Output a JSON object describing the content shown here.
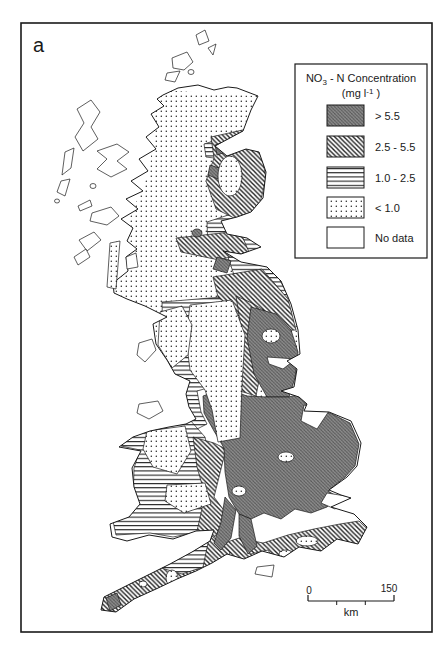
{
  "figure": {
    "panel_label": "a",
    "type": "choropleth-map"
  },
  "colors": {
    "ink": "#1a1a1a",
    "background": "#ffffff",
    "dark_zone_base": "#8f8f8f",
    "dark_zone_hatch": "#565656"
  },
  "legend": {
    "title_no": "NO",
    "title_sub": "3",
    "title_rest": " - N Concentration",
    "unit_open": "(mg l",
    "unit_sup": "-1",
    "unit_close": " )",
    "items": [
      {
        "label": "> 5.5",
        "pattern": "dark"
      },
      {
        "label": "2.5 - 5.5",
        "pattern": "diag"
      },
      {
        "label": "1.0 - 2.5",
        "pattern": "hlines"
      },
      {
        "label": "< 1.0",
        "pattern": "dots"
      },
      {
        "label": "No data",
        "pattern": "none"
      }
    ]
  },
  "scale_bar": {
    "start_label": "0",
    "end_label": "150",
    "unit_label": "km"
  },
  "map": {
    "categories": {
      "dark": "> 5.5 mg/l",
      "diag": "2.5 - 5.5 mg/l",
      "hlines": "1.0 - 2.5 mg/l",
      "dots": "< 1.0 mg/l",
      "none": "No data"
    },
    "mainland_path": "M163,95 L178,88 L198,85 L214,90 L228,87 L237,88 L258,96 L251,110 L243,131 L215,146 L227,156 L246,149 L259,152 L266,172 L263,198 L251,212 L237,217 L221,221 L227,234 L247,238 L261,247 L241,254 L223,251 L241,262 L267,267 L281,281 L291,304 L298,330 L300,354 L287,361 L297,369 L294,387 L281,391 L299,397 L307,404 L304,411 L329,412 L351,421 L361,443 L357,466 L347,477 L329,490 L341,495 L351,498 L331,507 L354,514 L367,527 L358,544 L337,539 L321,551 L299,547 L284,557 L262,551 L244,559 L227,554 L212,563 L196,571 L177,579 L156,589 L134,599 L116,612 L101,610 L104,597 L124,587 L146,576 L170,564 L192,552 L210,541 L214,530 L196,531 L173,539 L149,535 L127,541 L112,537 L110,524 L129,517 L140,504 L134,487 L132,468 L141,451 L119,447 L133,437 L150,431 L169,427 L186,424 L196,419 L189,407 L186,394 L190,381 L175,374 L167,360 L156,344 L153,324 L167,317 L145,306 L127,299 L114,293 L113,283 L128,271 L126,257 L137,249 L127,241 L133,228 L121,219 L138,209 L126,199 L143,191 L131,181 L148,171 L139,159 L156,149 L146,137 L159,127 L151,114 L164,106 L157,99 Z",
    "layers": [
      {
        "name": "scotland-north-england-base",
        "category": "dots",
        "clip": true,
        "type": "path",
        "stroke": false,
        "d": "M160,90 L258,96 L266,172 L262,250 L282,282 L298,330 L300,360 L293,392 L255,400 L215,385 L188,395 L170,372 L152,324 L112,290 L120,240 L150,170 L155,100 Z"
      },
      {
        "name": "moray-coast",
        "category": "hlines",
        "clip": true,
        "type": "path",
        "stroke": true,
        "d": "M204,144 L259,127 L267,147 L239,157 L222,159 L206,157 Z"
      },
      {
        "name": "tayside-fife",
        "category": "hlines",
        "clip": true,
        "type": "path",
        "stroke": true,
        "d": "M207,222 L262,204 L267,238 L262,253 L226,260 L208,249 Z"
      },
      {
        "name": "borders-coast",
        "category": "hlines",
        "clip": true,
        "type": "path",
        "stroke": true,
        "d": "M228,257 L270,262 L289,297 L263,299 L236,281 Z"
      },
      {
        "name": "pennines-ring",
        "category": "hlines",
        "clip": true,
        "type": "path",
        "stroke": true,
        "d": "M162,302 L246,295 L257,336 L250,390 L236,391 L218,385 L197,391 L201,412 L207,424 L195,430 L186,412 L180,396 L172,374 L163,338 Z"
      },
      {
        "name": "wales-band",
        "category": "hlines",
        "clip": true,
        "type": "path",
        "stroke": true,
        "d": "M113,431 L190,420 L205,437 L211,464 L201,494 L213,511 L212,529 L173,537 L150,533 L116,535 L113,521 L133,506 L134,468 L140,450 L121,446 Z"
      },
      {
        "name": "aberdeenshire",
        "category": "diag",
        "clip": true,
        "type": "path",
        "stroke": true,
        "d": "M211,137 L247,129 L261,149 L266,179 L258,211 L236,219 L216,209 L206,181 L214,158 Z"
      },
      {
        "name": "lothian",
        "category": "diag",
        "clip": true,
        "type": "path",
        "stroke": true,
        "d": "M176,238 L240,231 L249,252 L219,260 L181,252 Z"
      },
      {
        "name": "borders-cheviot",
        "category": "diag",
        "clip": true,
        "type": "path",
        "stroke": true,
        "d": "M213,277 L262,269 L288,299 L296,330 L271,331 L242,317 L218,297 Z"
      },
      {
        "name": "northeast-strip",
        "category": "diag",
        "clip": true,
        "type": "path",
        "stroke": true,
        "d": "M236,296 L252,303 L268,313 L263,360 L256,396 L240,391 L243,340 Z"
      },
      {
        "name": "welsh-border",
        "category": "diag",
        "clip": true,
        "type": "path",
        "stroke": true,
        "d": "M193,437 L214,443 L226,449 L214,497 L229,517 L213,539 L197,531 L205,495 L197,467 Z"
      },
      {
        "name": "south-coast-band",
        "category": "diag",
        "clip": true,
        "type": "path",
        "stroke": true,
        "d": "M216,546 L239,538 L263,543 L288,535 L314,529 L340,524 L359,521 L370,531 L357,549 L337,541 L320,553 L297,549 L281,560 L259,553 L241,561 L224,558 Z"
      },
      {
        "name": "southwest-peninsula",
        "category": "diag",
        "clip": true,
        "type": "path",
        "stroke": true,
        "d": "M212,536 L230,552 L228,560 L212,566 L194,574 L176,582 L154,592 L134,602 L117,614 L100,611 L104,596 L125,586 L147,575 L170,563 L192,551 Z"
      },
      {
        "name": "northeast-england",
        "category": "dark",
        "clip": true,
        "type": "path",
        "stroke": true,
        "d": "M251,307 L276,314 L291,330 L298,352 L295,378 L289,397 L267,397 L254,374 L247,338 Z"
      },
      {
        "name": "midlands-east-england",
        "category": "dark",
        "clip": true,
        "type": "path",
        "stroke": true,
        "d": "M203,396 L225,388 L247,396 L267,397 L289,397 L303,393 L309,409 L330,413 L350,423 L359,444 L355,466 L345,477 L328,491 L338,497 L327,507 L311,513 L295,509 L281,519 L264,513 L251,519 L239,514 L229,497 L225,472 L224,448 L214,431 L204,413 Z"
      },
      {
        "name": "hampshire-tongue",
        "category": "dark",
        "clip": true,
        "type": "path",
        "stroke": true,
        "d": "M239,514 L251,519 L257,546 L248,554 L239,536 Z"
      },
      {
        "name": "wessex-tongue",
        "category": "dark",
        "clip": true,
        "type": "path",
        "stroke": true,
        "d": "M225,497 L236,510 L231,538 L221,550 L214,543 L221,522 Z"
      },
      {
        "name": "banff-patch",
        "category": "dark",
        "clip": true,
        "type": "path",
        "stroke": true,
        "d": "M215,145 L227,141 L229,151 L217,155 Z"
      },
      {
        "name": "aberdeen-patch",
        "category": "dark",
        "clip": true,
        "type": "path",
        "stroke": true,
        "d": "M210,165 L222,169 L218,179 L208,175 Z"
      },
      {
        "name": "lothian-patch",
        "category": "dark",
        "clip": true,
        "type": "path",
        "stroke": true,
        "d": "M217,257 L231,261 L227,273 L213,269 Z"
      },
      {
        "name": "clyde-patch",
        "category": "dark",
        "clip": true,
        "type": "ellipse",
        "stroke": true,
        "cx": 197,
        "cy": 233,
        "rx": 5,
        "ry": 4
      },
      {
        "name": "cornwall-tip-patch",
        "category": "dark",
        "clip": true,
        "type": "path",
        "stroke": true,
        "d": "M106,598 L117,593 L121,605 L110,611 Z"
      },
      {
        "name": "aberdeenshire-core",
        "category": "dots",
        "clip": true,
        "type": "ellipse",
        "stroke": true,
        "cx": 230,
        "cy": 176,
        "rx": 12,
        "ry": 20
      },
      {
        "name": "pennines-core",
        "category": "dots",
        "clip": true,
        "type": "path",
        "stroke": true,
        "d": "M190,305 L232,300 L245,335 L242,385 L240,438 L218,442 L212,410 L205,390 L190,370 L186,338 Z"
      },
      {
        "name": "lake-district-core",
        "category": "dots",
        "clip": true,
        "type": "path",
        "stroke": true,
        "d": "M160,312 L182,306 L192,325 L188,355 L172,368 L158,345 Z"
      },
      {
        "name": "north-wales-core",
        "category": "dots",
        "clip": true,
        "type": "path",
        "stroke": true,
        "d": "M147,431 L185,426 L191,451 L177,474 L153,467 L143,449 Z"
      },
      {
        "name": "south-wales-core",
        "category": "dots",
        "clip": true,
        "type": "path",
        "stroke": true,
        "d": "M167,485 L205,483 L211,504 L184,513 L165,501 Z"
      },
      {
        "name": "devon-interior",
        "category": "hlines",
        "clip": true,
        "type": "path",
        "stroke": true,
        "d": "M151,541 L209,538 L203,567 L182,574 L151,565 Z"
      },
      {
        "name": "durham-oval",
        "category": "dots",
        "clip": true,
        "type": "ellipse",
        "stroke": true,
        "cx": 271,
        "cy": 336,
        "rx": 9,
        "ry": 7
      },
      {
        "name": "midlands-oval-1",
        "category": "dots",
        "clip": true,
        "type": "ellipse",
        "stroke": true,
        "cx": 239,
        "cy": 491,
        "rx": 7,
        "ry": 5
      },
      {
        "name": "midlands-oval-2",
        "category": "dots",
        "clip": true,
        "type": "ellipse",
        "stroke": true,
        "cx": 286,
        "cy": 457,
        "rx": 8,
        "ry": 5
      },
      {
        "name": "sussex-oval",
        "category": "dots",
        "clip": true,
        "type": "ellipse",
        "stroke": true,
        "cx": 307,
        "cy": 541,
        "rx": 11,
        "ry": 5
      },
      {
        "name": "dorset-oval",
        "category": "dots",
        "clip": true,
        "type": "ellipse",
        "stroke": true,
        "cx": 286,
        "cy": 554,
        "rx": 7,
        "ry": 4
      },
      {
        "name": "dartmoor-oval",
        "category": "dots",
        "clip": true,
        "type": "ellipse",
        "stroke": true,
        "cx": 172,
        "cy": 578,
        "rx": 6,
        "ry": 8
      },
      {
        "name": "bodmin-oval",
        "category": "dots",
        "clip": true,
        "type": "ellipse",
        "stroke": true,
        "cx": 143,
        "cy": 584,
        "rx": 4,
        "ry": 3
      },
      {
        "name": "tees-inlet",
        "category": "none",
        "clip": true,
        "type": "path",
        "stroke": true,
        "d": "M267,357 L296,359 L283,369 L269,364 Z"
      },
      {
        "name": "wash-inlet",
        "category": "none",
        "clip": true,
        "type": "path",
        "stroke": true,
        "d": "M304,405 L329,411 L317,429 L301,421 Z"
      },
      {
        "name": "thames-estuary",
        "category": "none",
        "clip": true,
        "type": "path",
        "stroke": true,
        "d": "M327,493 L352,497 L335,509 L321,503 Z"
      },
      {
        "name": "solent-white",
        "category": "none",
        "clip": true,
        "type": "path",
        "stroke": true,
        "d": "M251,554 L268,550 L275,561 L256,564 Z"
      },
      {
        "name": "mainland-outline",
        "category": "outline",
        "clip": false,
        "type": "path",
        "stroke": true,
        "d": "M163,95 L178,88 L198,85 L214,90 L228,87 L237,88 L258,96 L251,110 L243,131 L215,146 L227,156 L246,149 L259,152 L266,172 L263,198 L251,212 L237,217 L221,221 L227,234 L247,238 L261,247 L241,254 L223,251 L241,262 L267,267 L281,281 L291,304 L298,330 L300,354 L287,361 L297,369 L294,387 L281,391 L299,397 L307,404 L304,411 L329,412 L351,421 L361,443 L357,466 L347,477 L329,490 L341,495 L351,498 L331,507 L354,514 L367,527 L358,544 L337,539 L321,551 L299,547 L284,557 L262,551 L244,559 L227,554 L212,563 L196,571 L177,579 L156,589 L134,599 L116,612 L101,610 L104,597 L124,587 L146,576 L170,564 L192,552 L210,541 L214,530 L196,531 L173,539 L149,535 L127,541 L112,537 L110,524 L129,517 L140,504 L134,487 L132,468 L141,451 L119,447 L133,437 L150,431 L169,427 L186,424 L196,419 L189,407 L186,394 L190,381 L175,374 L167,360 L156,344 L153,324 L167,317 L145,306 L127,299 L114,293 L113,283 L128,271 L126,257 L137,249 L127,241 L133,228 L121,219 L138,209 L126,199 L143,191 L131,181 L148,171 L139,159 L156,149 L146,137 L159,127 L151,114 L164,106 L157,99 Z"
      },
      {
        "name": "shetland-1",
        "category": "none",
        "clip": false,
        "type": "path",
        "stroke": true,
        "d": "M196,35 L205,30 L209,41 L199,45 Z"
      },
      {
        "name": "shetland-2",
        "category": "none",
        "clip": false,
        "type": "path",
        "stroke": true,
        "d": "M208,48 L216,44 L213,55 Z"
      },
      {
        "name": "orkney-1",
        "category": "none",
        "clip": false,
        "type": "path",
        "stroke": true,
        "d": "M172,58 L187,52 L193,62 L184,70 L173,68 Z"
      },
      {
        "name": "orkney-2",
        "category": "none",
        "clip": false,
        "type": "path",
        "stroke": true,
        "d": "M167,73 L180,71 L175,82 L165,80 Z"
      },
      {
        "name": "orkney-3",
        "category": "none",
        "clip": false,
        "type": "ellipse",
        "stroke": true,
        "cx": 191,
        "cy": 72,
        "rx": 3,
        "ry": 2.5
      },
      {
        "name": "lewis-harris",
        "category": "none",
        "clip": false,
        "type": "path",
        "stroke": true,
        "d": "M77,109 L91,100 L100,112 L91,127 L98,139 L83,151 L75,137 L84,123 Z"
      },
      {
        "name": "uist-1",
        "category": "none",
        "clip": false,
        "type": "path",
        "stroke": true,
        "d": "M65,152 L74,148 L71,168 L62,175 Z"
      },
      {
        "name": "uist-2",
        "category": "none",
        "clip": false,
        "type": "path",
        "stroke": true,
        "d": "M61,181 L70,179 L65,196 L57,192 Z"
      },
      {
        "name": "barra",
        "category": "none",
        "clip": false,
        "type": "ellipse",
        "stroke": true,
        "cx": 57,
        "cy": 201,
        "rx": 2.5,
        "ry": 2
      },
      {
        "name": "skye",
        "category": "none",
        "clip": false,
        "type": "path",
        "stroke": true,
        "d": "M97,151 L117,144 L129,152 L117,161 L127,169 L111,177 L97,169 L107,159 Z"
      },
      {
        "name": "rum",
        "category": "none",
        "clip": false,
        "type": "ellipse",
        "stroke": true,
        "cx": 93,
        "cy": 186,
        "rx": 3,
        "ry": 2.5
      },
      {
        "name": "coll",
        "category": "none",
        "clip": false,
        "type": "path",
        "stroke": true,
        "d": "M78,206 L90,200 L92,206 L80,211 Z"
      },
      {
        "name": "mull",
        "category": "none",
        "clip": false,
        "type": "path",
        "stroke": true,
        "d": "M92,213 L111,207 L119,216 L107,225 L90,221 Z"
      },
      {
        "name": "islay",
        "category": "none",
        "clip": false,
        "type": "path",
        "stroke": true,
        "d": "M79,240 L94,232 L101,240 L87,251 Z"
      },
      {
        "name": "jura",
        "category": "none",
        "clip": false,
        "type": "path",
        "stroke": true,
        "d": "M74,257 L86,249 L90,257 L78,265 Z"
      },
      {
        "name": "arran",
        "category": "none",
        "clip": false,
        "type": "path",
        "stroke": true,
        "d": "M126,257 L136,253 L138,267 L127,269 Z"
      },
      {
        "name": "kintyre",
        "category": "dots",
        "clip": false,
        "type": "path",
        "stroke": true,
        "d": "M110,243 L120,241 L116,289 L107,287 Z"
      },
      {
        "name": "isle-of-man",
        "category": "none",
        "clip": false,
        "type": "path",
        "stroke": true,
        "d": "M139,343 L152,339 L156,350 L145,362 L137,355 Z"
      },
      {
        "name": "anglesey",
        "category": "none",
        "clip": false,
        "type": "path",
        "stroke": true,
        "d": "M139,404 L158,401 L163,411 L149,419 L137,413 Z"
      },
      {
        "name": "isle-of-wight",
        "category": "none",
        "clip": false,
        "type": "path",
        "stroke": true,
        "d": "M257,567 L274,565 L272,577 L255,574 Z"
      }
    ]
  }
}
